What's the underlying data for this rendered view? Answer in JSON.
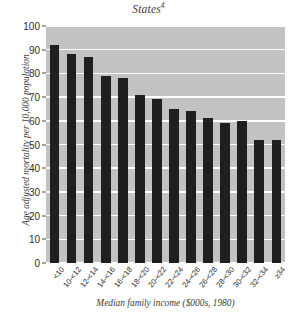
{
  "chart_data": {
    "type": "bar",
    "title": "States",
    "title_superscript": "4",
    "xlabel": "Median family income ($000s, 1980)",
    "ylabel": "Age adjusted mortality per 10,000 population",
    "ylim": [
      0,
      100
    ],
    "ytick_step": 10,
    "yticks": [
      100,
      90,
      80,
      70,
      60,
      50,
      40,
      30,
      20,
      10,
      0
    ],
    "grid": true,
    "grid_axis": "y",
    "legend": "none",
    "bar_color": "#1f1f1f",
    "plot_background_color": "#c2c2c2",
    "gridline_color": "#ffffff",
    "categories": [
      "<10",
      "10-<12",
      "12-<14",
      "14-<16",
      "16-<18",
      "18-<20",
      "20-<22",
      "22-<24",
      "24-<26",
      "26-<28",
      "28-<30",
      "30-<32",
      "32-<34",
      "≥34"
    ],
    "values": [
      92,
      88,
      87,
      79,
      78,
      71,
      69,
      65,
      64,
      61,
      59,
      60,
      52,
      52
    ]
  }
}
